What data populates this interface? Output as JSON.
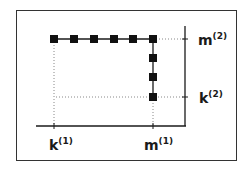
{
  "diagram": {
    "type": "lattice-path",
    "colors": {
      "line": "#1a1a1a",
      "marker": "#111111",
      "guide": "#888888",
      "frame": "#333333"
    },
    "axes": {
      "x_ticks": [
        {
          "id": "k1",
          "base": "k",
          "sup": "(1)"
        },
        {
          "id": "m1",
          "base": "m",
          "sup": "(1)"
        }
      ],
      "y_ticks": [
        {
          "id": "m2",
          "base": "m",
          "sup": "(2)"
        },
        {
          "id": "k2",
          "base": "k",
          "sup": "(2)"
        }
      ]
    },
    "path": {
      "description": "Horizontal run of 6 markers at level m(2) from k(1) to m(1), then vertical run down to k(2)",
      "top_row_marker_count": 6,
      "right_column_marker_count": 4
    }
  },
  "labels": {
    "k1_base": "k",
    "k1_sup": "(1)",
    "m1_base": "m",
    "m1_sup": "(1)",
    "m2_base": "m",
    "m2_sup": "(2)",
    "k2_base": "k",
    "k2_sup": "(2)"
  }
}
